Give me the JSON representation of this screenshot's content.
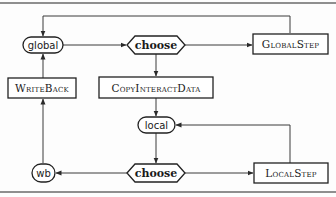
{
  "diagram": {
    "type": "flowchart",
    "nodes": {
      "global": {
        "label": "global",
        "shape": "rounded"
      },
      "choose_top": {
        "label": "choose",
        "shape": "hexagon"
      },
      "global_step": {
        "label": "GlobalStep",
        "shape": "rectangle"
      },
      "write_back": {
        "label": "WriteBack",
        "shape": "rectangle"
      },
      "copy_interact_data": {
        "label": "CopyInteractData",
        "shape": "rectangle"
      },
      "local": {
        "label": "local",
        "shape": "rounded"
      },
      "choose_bottom": {
        "label": "choose",
        "shape": "hexagon"
      },
      "local_step": {
        "label": "LocalStep",
        "shape": "rectangle"
      },
      "wb": {
        "label": "wb",
        "shape": "rounded"
      }
    },
    "edges": [
      {
        "from": "global",
        "to": "choose_top"
      },
      {
        "from": "choose_top",
        "to": "global_step"
      },
      {
        "from": "global_step",
        "to": "global"
      },
      {
        "from": "choose_top",
        "to": "copy_interact_data"
      },
      {
        "from": "copy_interact_data",
        "to": "local"
      },
      {
        "from": "local",
        "to": "choose_bottom"
      },
      {
        "from": "choose_bottom",
        "to": "local_step"
      },
      {
        "from": "local_step",
        "to": "local"
      },
      {
        "from": "choose_bottom",
        "to": "wb"
      },
      {
        "from": "wb",
        "to": "write_back"
      },
      {
        "from": "write_back",
        "to": "global"
      }
    ]
  }
}
